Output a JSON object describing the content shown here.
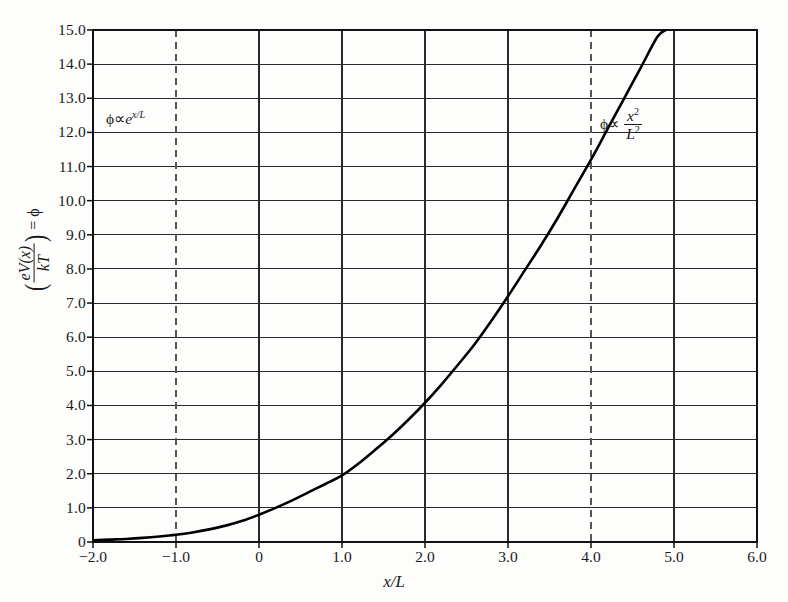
{
  "figure": {
    "background": "#fdfdfc",
    "ink": "#1a1a1a",
    "curve_color": "#000000"
  },
  "axes": {
    "x_title": "x/L",
    "y_title_parts": {
      "numerator": "eV(x)",
      "denominator": "kT",
      "equals": "= ",
      "phi": "ϕ"
    },
    "x_ticks": [
      "-2.0",
      "-1.0",
      "0",
      "1.0",
      "2.0",
      "3.0",
      "4.0",
      "5.0",
      "6.0"
    ],
    "y_ticks": [
      "0",
      "1.0",
      "2.0",
      "3.0",
      "4.0",
      "5.0",
      "6.0",
      "7.0",
      "8.0",
      "9.0",
      "10.0",
      "11.0",
      "12.0",
      "13.0",
      "14.0",
      "15.0"
    ]
  },
  "annotations": {
    "left": {
      "phi": "ϕ",
      "prop": "∝",
      "base": "e",
      "exponent": "x/L"
    },
    "right": {
      "phi": "ϕ",
      "prop": "∝",
      "num": "x",
      "num_sup": "2",
      "den": "L",
      "den_sup": "2"
    }
  },
  "chart_data": {
    "type": "line",
    "title": "",
    "xlabel": "x/L",
    "ylabel": "(eV(x)/kT) = ϕ",
    "xlim": [
      -2.0,
      6.0
    ],
    "ylim": [
      0.0,
      15.0
    ],
    "xticks": [
      -2.0,
      -1.0,
      0.0,
      1.0,
      2.0,
      3.0,
      4.0,
      5.0,
      6.0
    ],
    "yticks": [
      0,
      1,
      2,
      3,
      4,
      5,
      6,
      7,
      8,
      9,
      10,
      11,
      12,
      13,
      14,
      15
    ],
    "grid": true,
    "grid_style": "horizontal solid gridlines at every y tick; vertical solid lines at x=-2.0, 0, 1.0, 2.0, 3.0, 5.0, 6.0",
    "dashed_verticals": [
      -1.0,
      4.0
    ],
    "legend": null,
    "annotations": [
      {
        "text": "ϕ ∝ e^(x/L)",
        "x": -1.6,
        "y": 12.5,
        "meaning": "exponential regime at small/negative x"
      },
      {
        "text": "ϕ ∝ x²/L²",
        "x": 4.2,
        "y": 12.4,
        "meaning": "quadratic (Mott-Gurney / space-charge) regime at large x"
      }
    ],
    "series": [
      {
        "name": "ϕ(x/L)",
        "color": "#000000",
        "linewidth": 2.6,
        "x": [
          -2.0,
          -1.8,
          -1.6,
          -1.4,
          -1.2,
          -1.0,
          -0.8,
          -0.6,
          -0.4,
          -0.2,
          0.0,
          0.2,
          0.4,
          0.6,
          0.8,
          1.0,
          1.2,
          1.4,
          1.6,
          1.8,
          2.0,
          2.2,
          2.4,
          2.6,
          2.8,
          3.0,
          3.2,
          3.4,
          3.6,
          3.8,
          4.0,
          4.2,
          4.4,
          4.6,
          4.8,
          4.9
        ],
        "y": [
          0.05,
          0.07,
          0.09,
          0.12,
          0.16,
          0.21,
          0.28,
          0.37,
          0.48,
          0.62,
          0.8,
          1.0,
          1.22,
          1.46,
          1.7,
          1.95,
          2.3,
          2.7,
          3.12,
          3.58,
          4.08,
          4.62,
          5.2,
          5.8,
          6.48,
          7.2,
          7.95,
          8.7,
          9.5,
          10.35,
          11.2,
          12.1,
          13.0,
          13.9,
          14.8,
          15.0
        ]
      }
    ]
  }
}
